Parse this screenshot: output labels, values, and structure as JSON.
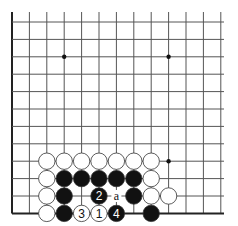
{
  "board": {
    "cols": 13,
    "rows": 12,
    "origin_x": 12,
    "origin_y": 22,
    "spacing": 17.4,
    "line_extend_right": 224,
    "left_edge_thick": true,
    "bottom_edge_thick": true,
    "hoshi": [
      [
        3,
        2
      ],
      [
        9,
        2
      ],
      [
        9,
        8
      ]
    ]
  },
  "stones": [
    {
      "c": 2,
      "r": 8,
      "color": "white"
    },
    {
      "c": 3,
      "r": 8,
      "color": "white"
    },
    {
      "c": 4,
      "r": 8,
      "color": "white"
    },
    {
      "c": 5,
      "r": 8,
      "color": "white"
    },
    {
      "c": 6,
      "r": 8,
      "color": "white"
    },
    {
      "c": 7,
      "r": 8,
      "color": "white"
    },
    {
      "c": 8,
      "r": 8,
      "color": "white"
    },
    {
      "c": 2,
      "r": 9,
      "color": "white"
    },
    {
      "c": 3,
      "r": 9,
      "color": "black"
    },
    {
      "c": 4,
      "r": 9,
      "color": "black"
    },
    {
      "c": 5,
      "r": 9,
      "color": "black"
    },
    {
      "c": 6,
      "r": 9,
      "color": "black"
    },
    {
      "c": 7,
      "r": 9,
      "color": "black"
    },
    {
      "c": 8,
      "r": 9,
      "color": "white"
    },
    {
      "c": 2,
      "r": 10,
      "color": "white"
    },
    {
      "c": 3,
      "r": 10,
      "color": "black"
    },
    {
      "c": 5,
      "r": 10,
      "color": "black",
      "label": "2"
    },
    {
      "c": 7,
      "r": 10,
      "color": "black"
    },
    {
      "c": 8,
      "r": 10,
      "color": "white"
    },
    {
      "c": 9,
      "r": 10,
      "color": "white"
    },
    {
      "c": 2,
      "r": 11,
      "color": "white"
    },
    {
      "c": 3,
      "r": 11,
      "color": "black"
    },
    {
      "c": 4,
      "r": 11,
      "color": "white",
      "label": "3"
    },
    {
      "c": 5,
      "r": 11,
      "color": "white",
      "label": "1"
    },
    {
      "c": 6,
      "r": 11,
      "color": "black",
      "label": "4"
    },
    {
      "c": 8,
      "r": 11,
      "color": "black"
    }
  ],
  "marks": [
    {
      "c": 6,
      "r": 10,
      "label": "a"
    }
  ],
  "colors": {
    "line": "#555555",
    "edge": "#222222",
    "black": "#111111",
    "white": "#ffffff",
    "stone_stroke": "#333333"
  }
}
